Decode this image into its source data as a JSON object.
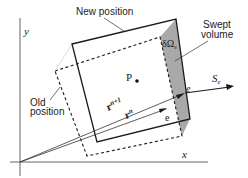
{
  "diagram": {
    "axes": {
      "x_label": "x",
      "y_label": "y"
    },
    "labels": {
      "new_position": "New position",
      "old_position_line1": "Old",
      "old_position_line2": "position",
      "swept_line1": "Swept",
      "swept_line2": "volume",
      "delta_omega": "δΩ",
      "delta_omega_sub": "e",
      "point_p": "P",
      "point_e_new": "e",
      "point_e_old": "e",
      "s_main": "S",
      "s_sub": "e",
      "r_new_main": "r",
      "r_new_sup": "n+1",
      "r_old_main": "r",
      "r_old_sup": "n"
    },
    "colors": {
      "line": "#1a1a1a",
      "swept_fill": "#a9a9a9",
      "axis": "#555555"
    }
  }
}
